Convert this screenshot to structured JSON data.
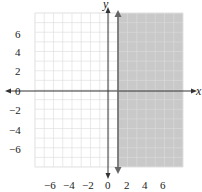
{
  "chart_data": {
    "type": "area",
    "title": "",
    "xlabel": "x",
    "ylabel": "y",
    "xlim": [
      -8,
      8
    ],
    "ylim": [
      -8,
      8
    ],
    "grid": true,
    "x_ticks": [
      -6,
      -4,
      -2,
      0,
      2,
      4,
      6
    ],
    "y_ticks": [
      6,
      4,
      2,
      0,
      -2,
      -4,
      -6
    ],
    "x_tick_labels": [
      "−6",
      "−4",
      "−2",
      "0",
      "2",
      "4",
      "6"
    ],
    "y_tick_labels": [
      "6",
      "4",
      "2",
      "0",
      "−2",
      "−4",
      "−6"
    ],
    "boundary": {
      "type": "vertical_line",
      "x": 1,
      "style": "solid"
    },
    "shaded_region": "x >= 1",
    "colors": {
      "shade": "#c9c9c9",
      "grid": "#dcdcdc",
      "axis": "#333333",
      "boundary": "#666666"
    }
  },
  "labels": {
    "x_axis": "x",
    "y_axis": "y"
  }
}
